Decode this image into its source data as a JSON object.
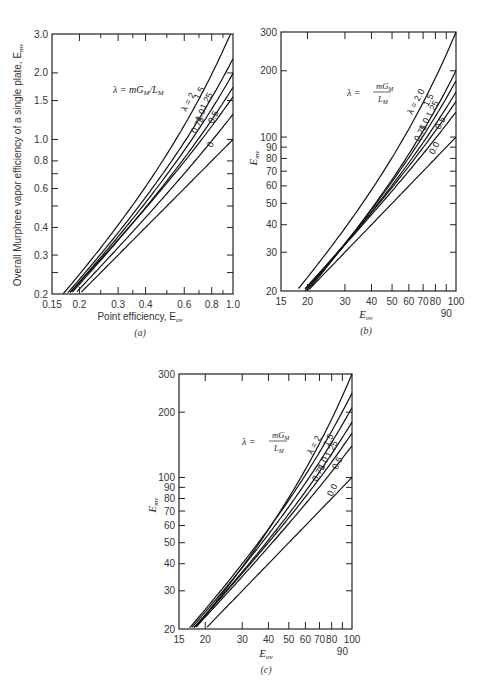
{
  "chart_data": [
    {
      "panel": "a",
      "type": "line",
      "title": "",
      "panel_label": "(a)",
      "xlabel": "Point efficiency, E_OV",
      "ylabel": "Overall Murphree vapor efficiency of a single plate, E_MV",
      "x_scale": "log",
      "y_scale": "log",
      "xlim": [
        0.15,
        1.0
      ],
      "ylim": [
        0.2,
        3.0
      ],
      "x_ticks": [
        0.15,
        0.2,
        0.3,
        0.4,
        0.6,
        0.8,
        1.0
      ],
      "x_tick_labels": [
        "0.15",
        "0.2",
        "0.3",
        "0.4",
        "0.6",
        "0.8",
        "1.0"
      ],
      "x_minor_ticks": [
        0.25,
        0.35,
        0.5,
        0.7,
        0.9
      ],
      "y_ticks": [
        0.2,
        0.3,
        0.4,
        0.6,
        0.8,
        1.0,
        1.5,
        2.0,
        3.0
      ],
      "y_tick_labels": [
        "0.2",
        "0.3",
        "0.4",
        "0.6",
        "0.8",
        "1.0",
        "1.5",
        "2.0",
        "3.0"
      ],
      "y_minor_ticks": [
        0.25,
        0.5,
        0.7
      ],
      "annotation": "λ = mG_M/L_M",
      "legend_position": "curve labels near right edge",
      "grid": false,
      "series": [
        {
          "name": "λ = 2",
          "lambda": 2.0,
          "end_value": 3.19
        },
        {
          "name": "1.5",
          "lambda": 1.5,
          "end_value": 2.32
        },
        {
          "name": "1.25",
          "lambda": 1.25,
          "end_value": 1.99
        },
        {
          "name": "1.0",
          "lambda": 1.0,
          "end_value": 1.72
        },
        {
          "name": "0.75",
          "lambda": 0.75,
          "end_value": 1.56
        },
        {
          "name": "0.5",
          "lambda": 0.5,
          "end_value": 1.3
        },
        {
          "name": "0",
          "lambda": 0.0,
          "end_value": 1.0
        }
      ]
    },
    {
      "panel": "b",
      "type": "line",
      "title": "",
      "panel_label": "(b)",
      "xlabel": "E_OV",
      "ylabel": "E_MV",
      "x_scale": "log",
      "y_scale": "log",
      "xlim": [
        15,
        100
      ],
      "ylim": [
        20,
        300
      ],
      "x_ticks": [
        15,
        20,
        30,
        40,
        50,
        60,
        70,
        80,
        90,
        100
      ],
      "x_tick_labels": [
        "15",
        "20",
        "30",
        "40",
        "50",
        "60",
        "70",
        "80",
        "90",
        "100"
      ],
      "y_ticks": [
        20,
        30,
        40,
        50,
        60,
        70,
        80,
        90,
        100,
        200,
        300
      ],
      "y_tick_labels": [
        "20",
        "30",
        "40",
        "50",
        "60",
        "70",
        "80",
        "90",
        "100",
        "200",
        "300"
      ],
      "annotation": "λ = mG_M / L_M",
      "grid": false,
      "series": [
        {
          "name": "λ = 2.0",
          "lambda": 2.0,
          "end_value": 300
        },
        {
          "name": "1.5",
          "lambda": 1.5,
          "end_value": 200
        },
        {
          "name": "1.25",
          "lambda": 1.25,
          "end_value": 180
        },
        {
          "name": "1.0",
          "lambda": 1.0,
          "end_value": 160
        },
        {
          "name": "0.75",
          "lambda": 0.75,
          "end_value": 145
        },
        {
          "name": "0.5",
          "lambda": 0.5,
          "end_value": 130
        },
        {
          "name": "0.0",
          "lambda": 0.0,
          "end_value": 100
        }
      ]
    },
    {
      "panel": "c",
      "type": "line",
      "title": "",
      "panel_label": "(c)",
      "xlabel": "E_OV",
      "ylabel": "E_MV",
      "x_scale": "log",
      "y_scale": "log",
      "xlim": [
        15,
        100
      ],
      "ylim": [
        20,
        300
      ],
      "x_ticks": [
        15,
        20,
        30,
        40,
        50,
        60,
        70,
        80,
        90,
        100
      ],
      "x_tick_labels": [
        "15",
        "20",
        "30",
        "40",
        "50",
        "60",
        "70",
        "80",
        "90",
        "100"
      ],
      "y_ticks": [
        20,
        30,
        40,
        50,
        60,
        70,
        80,
        90,
        100,
        200,
        300
      ],
      "y_tick_labels": [
        "20",
        "30",
        "40",
        "50",
        "60",
        "70",
        "80",
        "90",
        "100",
        "200",
        "300"
      ],
      "annotation": "λ = mG_M / L_M",
      "grid": false,
      "series": [
        {
          "name": "λ = 2",
          "lambda": 2.0,
          "end_value": 300
        },
        {
          "name": "1.5",
          "lambda": 1.5,
          "end_value": 245
        },
        {
          "name": "1.25",
          "lambda": 1.25,
          "end_value": 210
        },
        {
          "name": "1.0",
          "lambda": 1.0,
          "end_value": 180
        },
        {
          "name": "0.75",
          "lambda": 0.75,
          "end_value": 160
        },
        {
          "name": "0.5",
          "lambda": 0.5,
          "end_value": 140
        },
        {
          "name": "0.0",
          "lambda": 0.0,
          "end_value": 100
        }
      ]
    }
  ],
  "labels": {
    "a": {
      "ylabel": "Overall Murphree vapor efficiency of a single plate, E",
      "ylabel_sub": "mv",
      "xlabel": "Point efficiency, E",
      "xlabel_sub": "ov",
      "panel": "(a)",
      "annotation": "λ = mG",
      "annotation_sub1": "M",
      "annotation_mid": "/L",
      "annotation_sub2": "M"
    },
    "b": {
      "ylabel": "E",
      "ylabel_sub": "mv",
      "xlabel": "E",
      "xlabel_sub": "ov",
      "panel": "(b)",
      "lambda_eq": "λ =",
      "num": "mG",
      "num_sub": "M",
      "den": "L",
      "den_sub": "M"
    },
    "c": {
      "ylabel": "E",
      "ylabel_sub": "mv",
      "xlabel": "E",
      "xlabel_sub": "ov",
      "panel": "(c)",
      "lambda_eq": "λ =",
      "num": "mG",
      "num_sub": "M",
      "den": "L",
      "den_sub": "M"
    }
  }
}
